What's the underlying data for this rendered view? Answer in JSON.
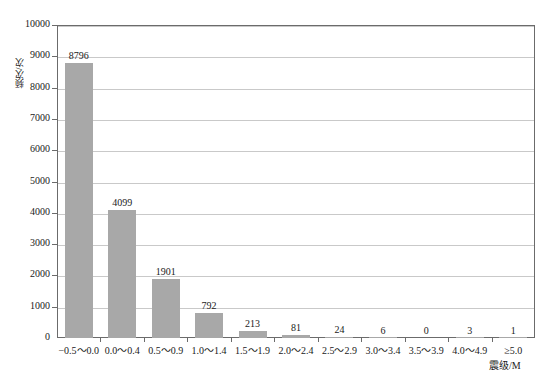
{
  "chart_data": {
    "type": "bar",
    "title": "",
    "subtitle": "",
    "xlabel": "震级/M",
    "ylabel": "频次/次",
    "categories": [
      "−0.5～0.0",
      "0.0～0.4",
      "0.5～0.9",
      "1.0～1.4",
      "1.5～1.9",
      "2.0～2.4",
      "2.5～2.9",
      "3.0～3.4",
      "3.5～3.9",
      "4.0～4.9",
      "≥5.0"
    ],
    "values": [
      8796,
      4099,
      1901,
      792,
      213,
      81,
      24,
      6,
      0,
      3,
      1
    ],
    "value_labels": [
      "8796",
      "4099",
      "1901",
      "792",
      "213",
      "81",
      "24",
      "6",
      "0",
      "3",
      "1"
    ],
    "ylim": [
      0,
      10000
    ],
    "ytick_values": [
      0,
      1000,
      2000,
      3000,
      4000,
      5000,
      6000,
      7000,
      8000,
      9000,
      10000
    ],
    "ytick_labels": [
      "0",
      "1000",
      "2000",
      "3000",
      "4000",
      "5000",
      "6000",
      "7000",
      "8000",
      "9000",
      "10000"
    ],
    "grid": true,
    "grid_axis": "y",
    "legend": false,
    "legend_position": "none",
    "bar_color": "#a8a8a8",
    "grid_color": "#c9c9c9",
    "axis_color": "#6b6b6b",
    "text_color": "#1a1a1a",
    "background_color": "#ffffff"
  }
}
